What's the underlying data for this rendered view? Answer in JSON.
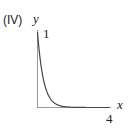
{
  "panel_label": "(IV)",
  "chart_data": {
    "type": "line",
    "title": "",
    "panel": "(IV)",
    "xlabel": "x",
    "ylabel": "y",
    "x_ticks": [
      "4"
    ],
    "y_ticks": [
      "1"
    ],
    "xlim": [
      0,
      4
    ],
    "ylim": [
      0,
      1
    ],
    "grid": false,
    "legend": null,
    "series": [
      {
        "name": "exponential decay",
        "x": [
          0,
          0.1,
          0.2,
          0.3,
          0.4,
          0.5,
          0.75,
          1.0,
          1.5,
          2.0,
          3.0,
          4.0
        ],
        "y": [
          1.0,
          0.74,
          0.55,
          0.41,
          0.3,
          0.22,
          0.11,
          0.05,
          0.01,
          0.0,
          0.0,
          0.0
        ]
      }
    ]
  },
  "axis_labels": {
    "x": "x",
    "y": "y",
    "x_tick": "4",
    "y_tick": "1"
  },
  "colors": {
    "curve": "#444444",
    "axis": "#9a9a9a",
    "text": "#222222"
  }
}
